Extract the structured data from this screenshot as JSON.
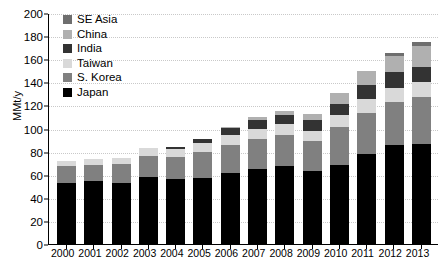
{
  "chart_data": {
    "type": "bar",
    "subtype": "stacked-vertical",
    "title": "",
    "xlabel": "",
    "ylabel": "MMt/y",
    "ylim": [
      0,
      200
    ],
    "ytick_step": 20,
    "yticks": [
      0,
      20,
      40,
      60,
      80,
      100,
      120,
      140,
      160,
      180,
      200
    ],
    "grid": true,
    "grid_axis": "y",
    "legend_position": "top-left-inside",
    "legend_order_top_to_bottom": [
      "SE Asia",
      "China",
      "India",
      "Taiwan",
      "S. Korea",
      "Japan"
    ],
    "stack_order_bottom_to_top": [
      "Japan",
      "S. Korea",
      "Taiwan",
      "India",
      "China",
      "SE Asia"
    ],
    "categories": [
      "2000",
      "2001",
      "2002",
      "2003",
      "2004",
      "2005",
      "2006",
      "2007",
      "2008",
      "2009",
      "2010",
      "2011",
      "2012",
      "2013"
    ],
    "series": [
      {
        "name": "Japan",
        "color": "#000000",
        "values": [
          54.0,
          55.5,
          54.0,
          58.5,
          57.0,
          58.0,
          62.0,
          66.0,
          68.5,
          64.5,
          69.0,
          78.5,
          87.0,
          87.5
        ]
      },
      {
        "name": "S. Korea",
        "color": "#808080",
        "values": [
          14.0,
          14.0,
          16.0,
          19.0,
          19.5,
          22.5,
          24.5,
          25.5,
          27.0,
          25.5,
          33.0,
          35.5,
          36.5,
          40.5
        ]
      },
      {
        "name": "Taiwan",
        "color": "#d9d9d9",
        "values": [
          5.0,
          5.0,
          5.5,
          6.5,
          7.0,
          7.5,
          8.5,
          9.0,
          9.0,
          8.5,
          11.0,
          12.0,
          12.5,
          13.0
        ]
      },
      {
        "name": "India",
        "color": "#333333",
        "values": [
          0.0,
          0.0,
          0.0,
          0.0,
          1.5,
          3.5,
          6.5,
          7.5,
          8.0,
          9.5,
          9.0,
          12.5,
          13.5,
          13.0
        ]
      },
      {
        "name": "China",
        "color": "#b0b0b0",
        "values": [
          0.0,
          0.0,
          0.0,
          0.0,
          0.0,
          0.0,
          0.5,
          2.5,
          3.5,
          5.5,
          9.5,
          12.0,
          14.5,
          18.0
        ]
      },
      {
        "name": "SE Asia",
        "color": "#6e6e6e",
        "values": [
          0.0,
          0.0,
          0.0,
          0.0,
          0.0,
          0.0,
          0.0,
          0.0,
          0.0,
          0.0,
          0.0,
          0.5,
          2.0,
          3.5
        ]
      }
    ],
    "totals": [
      73.0,
      74.5,
      75.5,
      84.0,
      85.0,
      91.5,
      102.0,
      110.5,
      116.0,
      113.5,
      131.5,
      151.0,
      166.0,
      175.5
    ]
  },
  "legend": {
    "items": [
      {
        "label": "SE Asia",
        "color": "#6e6e6e"
      },
      {
        "label": "China",
        "color": "#b0b0b0"
      },
      {
        "label": "India",
        "color": "#333333"
      },
      {
        "label": "Taiwan",
        "color": "#d9d9d9"
      },
      {
        "label": "S. Korea",
        "color": "#808080"
      },
      {
        "label": "Japan",
        "color": "#000000"
      }
    ]
  },
  "axes": {
    "y_title": "MMt/y",
    "y_tick_labels": [
      "200",
      "180",
      "160",
      "140",
      "120",
      "100",
      "80",
      "60",
      "40",
      "20",
      "0"
    ],
    "x_tick_labels": [
      "2000",
      "2001",
      "2002",
      "2003",
      "2004",
      "2005",
      "2006",
      "2007",
      "2008",
      "2009",
      "2010",
      "2011",
      "2012",
      "2013"
    ]
  },
  "colors": {
    "axis": "#000000",
    "grid": "#c9c9c9",
    "background": "#ffffff"
  }
}
